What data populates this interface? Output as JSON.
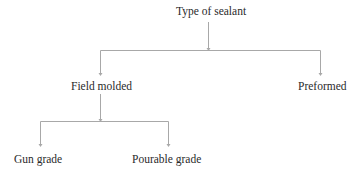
{
  "diagram": {
    "type": "tree",
    "line_color": "#a8a8a8",
    "text_color": "#2a2a2a",
    "nodes": {
      "root": {
        "label": "Type of sealant"
      },
      "field_molded": {
        "label": "Field molded"
      },
      "preformed": {
        "label": "Preformed"
      },
      "gun_grade": {
        "label": "Gun grade"
      },
      "pourable_grade": {
        "label": "Pourable grade"
      }
    },
    "edges": [
      {
        "from": "Type of sealant",
        "to": "Field molded"
      },
      {
        "from": "Type of sealant",
        "to": "Preformed"
      },
      {
        "from": "Field molded",
        "to": "Gun grade"
      },
      {
        "from": "Field molded",
        "to": "Pourable grade"
      }
    ]
  }
}
